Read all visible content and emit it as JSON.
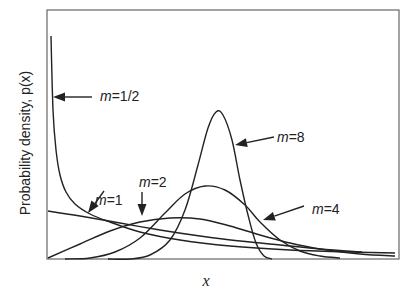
{
  "chart_data": {
    "type": "line",
    "title": "",
    "xlabel": "x",
    "ylabel": "Probability density, p(x)",
    "grid": false,
    "legend": "inline annotations with arrows",
    "series": [
      {
        "name": "m=1/2",
        "label_prefix": "m",
        "label_value": "=1/2",
        "points": [
          [
            51,
            36
          ],
          [
            53,
            110
          ],
          [
            56,
            150
          ],
          [
            60,
            175
          ],
          [
            66,
            192
          ],
          [
            75,
            204
          ],
          [
            90,
            214
          ],
          [
            110,
            222
          ],
          [
            140,
            232
          ],
          [
            180,
            240
          ],
          [
            230,
            246
          ],
          [
            290,
            250
          ],
          [
            350,
            252
          ],
          [
            395,
            253
          ]
        ]
      },
      {
        "name": "m=1",
        "label_prefix": "m",
        "label_value": "=1",
        "points": [
          [
            48,
            211
          ],
          [
            80,
            216
          ],
          [
            120,
            223
          ],
          [
            160,
            230
          ],
          [
            200,
            236
          ],
          [
            240,
            241
          ],
          [
            280,
            245
          ],
          [
            320,
            249
          ],
          [
            362,
            252
          ]
        ]
      },
      {
        "name": "m=2",
        "label_prefix": "m",
        "label_value": "=2",
        "points": [
          [
            48,
            258
          ],
          [
            80,
            244
          ],
          [
            110,
            231
          ],
          [
            140,
            222
          ],
          [
            170,
            218
          ],
          [
            200,
            219
          ],
          [
            230,
            226
          ],
          [
            260,
            235
          ],
          [
            290,
            243
          ],
          [
            320,
            249
          ],
          [
            360,
            254
          ],
          [
            395,
            256
          ]
        ]
      },
      {
        "name": "m=4",
        "label_prefix": "m",
        "label_value": "=4",
        "points": [
          [
            65,
            259
          ],
          [
            90,
            258
          ],
          [
            115,
            252
          ],
          [
            140,
            238
          ],
          [
            165,
            213
          ],
          [
            185,
            194
          ],
          [
            205,
            186
          ],
          [
            225,
            190
          ],
          [
            245,
            205
          ],
          [
            260,
            222
          ],
          [
            280,
            240
          ],
          [
            300,
            251
          ],
          [
            320,
            256
          ],
          [
            340,
            258
          ]
        ]
      },
      {
        "name": "m=8",
        "label_prefix": "m",
        "label_value": "=8",
        "points": [
          [
            108,
            259
          ],
          [
            130,
            259
          ],
          [
            150,
            255
          ],
          [
            170,
            240
          ],
          [
            185,
            210
          ],
          [
            198,
            165
          ],
          [
            208,
            128
          ],
          [
            216,
            112
          ],
          [
            223,
            115
          ],
          [
            232,
            140
          ],
          [
            240,
            180
          ],
          [
            248,
            215
          ],
          [
            256,
            243
          ],
          [
            264,
            256
          ],
          [
            272,
            259
          ]
        ]
      }
    ],
    "annotations": [
      {
        "series": "m=1/2",
        "text_x": 100,
        "text_y": 101,
        "arrow_from": [
          92,
          97
        ],
        "arrow_to": [
          53,
          97
        ]
      },
      {
        "series": "m=1",
        "text_x": 95,
        "text_y": 205,
        "arrow_from": [
          104,
          191
        ],
        "arrow_to": [
          88,
          213
        ]
      },
      {
        "series": "m=2",
        "text_x": 139,
        "text_y": 187,
        "arrow_from": [
          142,
          192
        ],
        "arrow_to": [
          142,
          216
        ]
      },
      {
        "series": "m=4",
        "text_x": 312,
        "text_y": 214,
        "arrow_from": [
          304,
          206
        ],
        "arrow_to": [
          263,
          220
        ]
      },
      {
        "series": "m=8",
        "text_x": 277,
        "text_y": 142,
        "arrow_from": [
          274,
          137
        ],
        "arrow_to": [
          235,
          145
        ]
      }
    ],
    "frame": {
      "left": 47,
      "top": 10,
      "right": 399,
      "bottom": 259
    }
  }
}
